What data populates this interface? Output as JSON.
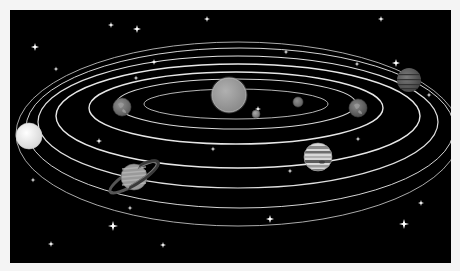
{
  "canvas": {
    "width": 460,
    "height": 271,
    "background": "#f4f4f4"
  },
  "space": {
    "x": 10,
    "y": 10,
    "width": 441,
    "height": 253,
    "color": "#000000"
  },
  "sun": {
    "cx": 229,
    "cy": 95,
    "r": 17,
    "fill": "#9a9a9a",
    "stroke": "#bdbdbd"
  },
  "orbits": [
    {
      "cx": 236,
      "cy": 104,
      "rx": 92,
      "ry": 15,
      "stroke": "#c8c8c8",
      "width": 0.9
    },
    {
      "cx": 236,
      "cy": 104,
      "rx": 120,
      "ry": 25,
      "stroke": "#d8d8d8",
      "width": 1.1
    },
    {
      "cx": 236,
      "cy": 108,
      "rx": 147,
      "ry": 36,
      "stroke": "#e6e6e6",
      "width": 1.4
    },
    {
      "cx": 238,
      "cy": 116,
      "rx": 182,
      "ry": 52,
      "stroke": "#e8e8e8",
      "width": 1.4
    },
    {
      "cx": 238,
      "cy": 122,
      "rx": 200,
      "ry": 66,
      "stroke": "#e0e0e0",
      "width": 1.2
    },
    {
      "cx": 240,
      "cy": 128,
      "rx": 214,
      "ry": 80,
      "stroke": "#d4d4d4",
      "width": 1.0
    },
    {
      "cx": 238,
      "cy": 134,
      "rx": 222,
      "ry": 92,
      "stroke": "#bdbdbd",
      "width": 0.9
    }
  ],
  "planets": [
    {
      "name": "mercury",
      "cx": 256,
      "cy": 114,
      "r": 4,
      "fill": "#8c8c8c"
    },
    {
      "name": "venus",
      "cx": 298,
      "cy": 102,
      "r": 5,
      "fill": "#7a7a7a"
    },
    {
      "name": "earth",
      "cx": 122,
      "cy": 107,
      "r": 9,
      "fill": "#6f6f6f"
    },
    {
      "name": "mars",
      "cx": 358,
      "cy": 108,
      "r": 9,
      "fill": "#5e5e5e"
    },
    {
      "name": "jupiter",
      "cx": 318,
      "cy": 157,
      "r": 14,
      "fill": "#c9c9c9"
    },
    {
      "name": "saturn",
      "cx": 134,
      "cy": 177,
      "r": 13,
      "fill": "#9a9a9a"
    },
    {
      "name": "uranus",
      "cx": 29,
      "cy": 136,
      "r": 13,
      "fill": "#e9e9e9"
    },
    {
      "name": "neptune",
      "cx": 409,
      "cy": 80,
      "r": 12,
      "fill": "#5b5b5b"
    }
  ],
  "saturn_ring": {
    "cx": 134,
    "cy": 177,
    "rx": 28,
    "ry": 7,
    "rotate": -32,
    "stroke": "#555555",
    "width": 3
  },
  "stars": [
    {
      "x": 35,
      "y": 47,
      "s": 4
    },
    {
      "x": 111,
      "y": 25,
      "s": 3
    },
    {
      "x": 137,
      "y": 29,
      "s": 4
    },
    {
      "x": 207,
      "y": 19,
      "s": 3
    },
    {
      "x": 56,
      "y": 69,
      "s": 2.5
    },
    {
      "x": 154,
      "y": 62,
      "s": 3
    },
    {
      "x": 136,
      "y": 78,
      "s": 2.5
    },
    {
      "x": 286,
      "y": 52,
      "s": 2.5
    },
    {
      "x": 381,
      "y": 19,
      "s": 3
    },
    {
      "x": 396,
      "y": 63,
      "s": 4
    },
    {
      "x": 357,
      "y": 64,
      "s": 2.5
    },
    {
      "x": 429,
      "y": 95,
      "s": 2.5
    },
    {
      "x": 99,
      "y": 141,
      "s": 3
    },
    {
      "x": 213,
      "y": 149,
      "s": 2.5
    },
    {
      "x": 358,
      "y": 139,
      "s": 2.5
    },
    {
      "x": 290,
      "y": 171,
      "s": 2.5
    },
    {
      "x": 33,
      "y": 180,
      "s": 2.5
    },
    {
      "x": 130,
      "y": 208,
      "s": 2.5
    },
    {
      "x": 113,
      "y": 226,
      "s": 5
    },
    {
      "x": 51,
      "y": 244,
      "s": 3
    },
    {
      "x": 163,
      "y": 245,
      "s": 3
    },
    {
      "x": 270,
      "y": 219,
      "s": 4
    },
    {
      "x": 421,
      "y": 203,
      "s": 3
    },
    {
      "x": 404,
      "y": 224,
      "s": 5
    },
    {
      "x": 258,
      "y": 109,
      "s": 3
    }
  ]
}
